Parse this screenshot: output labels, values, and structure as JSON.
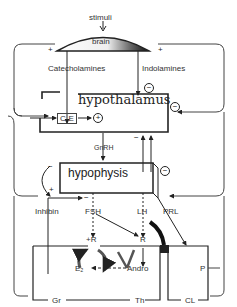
{
  "diagram": {
    "stimuli": "stimuli",
    "brain": "brain",
    "catecholamines": "Catecholamines",
    "indolamines": "Indolamines",
    "hypothalamus": "hypothalamus",
    "ce": "C-E",
    "gnrh": "GnRH",
    "hypophysis": "hypophysis",
    "inhibin": "Inhibin",
    "fsh": "FSH",
    "lh": "LH",
    "prl": "PRL",
    "r_left": "+R",
    "r_right": "R",
    "e2": "E₂",
    "andro": "Andro",
    "gr": "Gr",
    "th": "Th",
    "p": "P",
    "cl": "CL",
    "plus": "+",
    "minus": "−",
    "circle_plus": "+",
    "circle_minus": "−"
  },
  "colors": {
    "line": "#222222",
    "background": "#ffffff"
  }
}
